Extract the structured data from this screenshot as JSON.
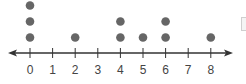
{
  "chart_data": {
    "type": "scatter",
    "subtype": "dot_plot",
    "title": "",
    "xlabel": "",
    "ylabel": "",
    "categories": [
      0,
      1,
      2,
      3,
      4,
      5,
      6,
      7,
      8
    ],
    "tick_labels": [
      "0",
      "1",
      "2",
      "3",
      "4",
      "5",
      "6",
      "7",
      "8"
    ],
    "counts": [
      3,
      0,
      1,
      0,
      2,
      1,
      2,
      0,
      1
    ],
    "xlim": [
      0,
      8
    ],
    "grid": false,
    "legend": null,
    "arrows": "both ends"
  },
  "colors": {
    "dot": "#666666",
    "axis": "#333333",
    "label": "#444444"
  }
}
